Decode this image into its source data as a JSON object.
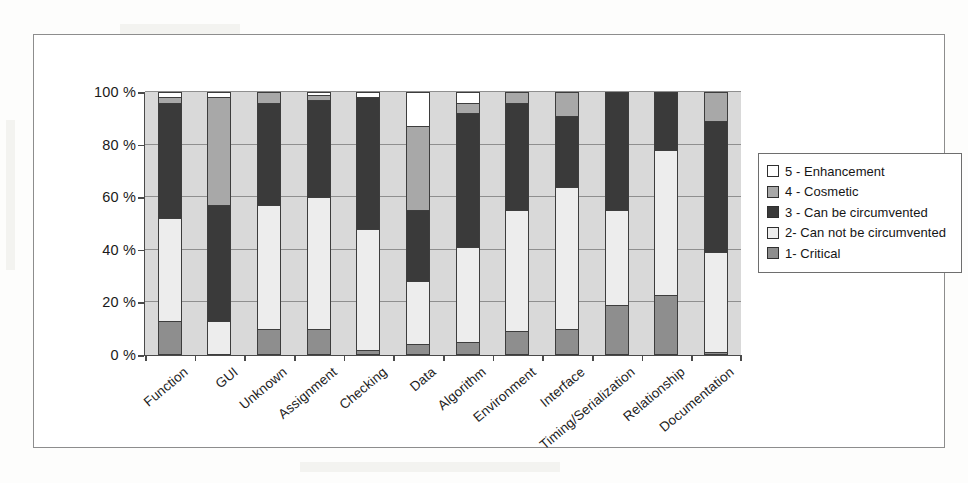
{
  "figure": {
    "frame_border_color": "#8d8d8d",
    "plot_background": "#d9d9d9",
    "axis_color": "#4a4a4a"
  },
  "legend": {
    "position": "right",
    "entries": [
      {
        "key": "5",
        "label": "5 - Enhancement",
        "color": "#ffffff"
      },
      {
        "key": "4",
        "label": "4 - Cosmetic",
        "color": "#a8a8a8"
      },
      {
        "key": "3",
        "label": "3 - Can be circumvented",
        "color": "#3a3a3a"
      },
      {
        "key": "2",
        "label": "2- Can not be circumvented",
        "color": "#ededed"
      },
      {
        "key": "1",
        "label": "1- Critical",
        "color": "#8e8e8e"
      }
    ]
  },
  "chart_data": {
    "type": "bar",
    "stacked": true,
    "normalized_percent": true,
    "title": "",
    "subtitle": "",
    "xlabel": "",
    "ylabel": "",
    "ylim": [
      0,
      100
    ],
    "ytick_labels": [
      "100 %",
      "80 %",
      "60 %",
      "40 %",
      "20 %",
      "0 %"
    ],
    "yticks": [
      100,
      80,
      60,
      40,
      20,
      0
    ],
    "grid": true,
    "grid_axis": "y",
    "legend_position": "right",
    "categories": [
      "Function",
      "GUI",
      "Unknown",
      "Assignment",
      "Checking",
      "Data",
      "Algorithm",
      "Environment",
      "Interface",
      "Timing/Serialization",
      "Relationship",
      "Documentation"
    ],
    "series": [
      {
        "name": "1- Critical",
        "color": "#8e8e8e",
        "values": [
          13,
          0,
          10,
          10,
          2,
          4,
          5,
          9,
          10,
          19,
          23,
          1
        ]
      },
      {
        "name": "2- Can not be circumvented",
        "color": "#ededed",
        "values": [
          39,
          13,
          47,
          50,
          46,
          24,
          36,
          46,
          54,
          36,
          55,
          38
        ]
      },
      {
        "name": "3 - Can be circumvented",
        "color": "#3a3a3a",
        "values": [
          44,
          44,
          39,
          37,
          50,
          27,
          51,
          41,
          27,
          45,
          22,
          50
        ]
      },
      {
        "name": "4 - Cosmetic",
        "color": "#a8a8a8",
        "values": [
          2,
          41,
          4,
          2,
          0,
          32,
          4,
          4,
          9,
          0,
          0,
          11
        ]
      },
      {
        "name": "5 - Enhancement",
        "color": "#ffffff",
        "values": [
          2,
          2,
          0,
          1,
          2,
          13,
          4,
          0,
          0,
          0,
          0,
          0
        ]
      }
    ]
  }
}
